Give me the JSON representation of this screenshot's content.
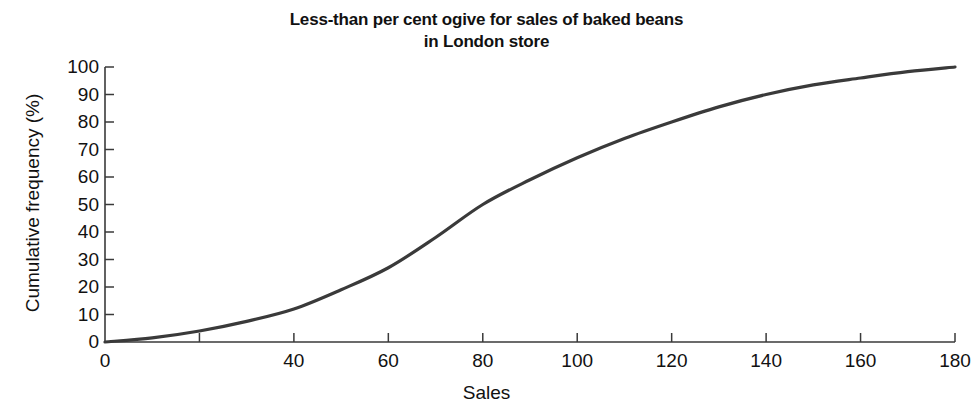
{
  "chart_data": {
    "type": "line",
    "title": "Less-than per cent ogive for sales of baked beans in London store",
    "title_lines": [
      "Less-than per cent ogive for sales of baked beans",
      "in London store"
    ],
    "xlabel": "Sales",
    "ylabel": "Cumulative frequency (%)",
    "xlim": [
      0,
      180
    ],
    "ylim": [
      0,
      100
    ],
    "grid": false,
    "legend": null,
    "xticks": [
      0,
      20,
      40,
      60,
      80,
      100,
      120,
      140,
      160,
      180
    ],
    "xtick_labels": [
      "0",
      "",
      "40",
      "60",
      "80",
      "100",
      "120",
      "140",
      "160",
      "180"
    ],
    "yticks": [
      0,
      10,
      20,
      30,
      40,
      50,
      60,
      70,
      80,
      90,
      100
    ],
    "ytick_labels": [
      "0",
      "10",
      "20",
      "30",
      "40",
      "50",
      "60",
      "70",
      "80",
      "90",
      "100"
    ],
    "series": [
      {
        "name": "Cumulative frequency",
        "color": "#3a3a3a",
        "line_width": 3.2,
        "x": [
          0,
          10,
          20,
          30,
          40,
          50,
          60,
          70,
          80,
          90,
          100,
          110,
          120,
          130,
          140,
          150,
          160,
          170,
          180
        ],
        "values": [
          0,
          1.5,
          4,
          7.5,
          12,
          19,
          27,
          38,
          50,
          59,
          67,
          74,
          80,
          85.5,
          90,
          93.5,
          96,
          98.3,
          100
        ]
      }
    ],
    "annotations": [],
    "colors": {
      "axis": "#3a3a3a",
      "curve": "#3a3a3a",
      "text": "#111111",
      "background": "#ffffff"
    }
  },
  "geometry": {
    "plot_left": 105,
    "plot_right": 955,
    "plot_top": 67,
    "plot_bottom": 342
  }
}
